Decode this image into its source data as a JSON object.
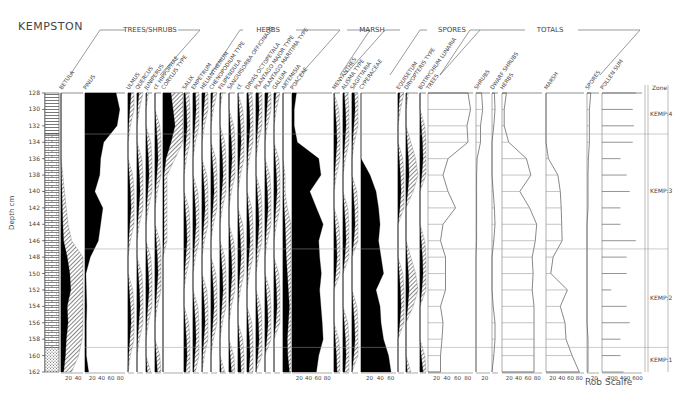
{
  "title": "KEMPSTON",
  "author": "Rob Scaife",
  "chart_data": {
    "type": "area",
    "title": "KEMPSTON",
    "ylabel": "Depth cm",
    "ylim": [
      128,
      162
    ],
    "y_ticks": [
      128,
      130,
      132,
      134,
      136,
      138,
      140,
      142,
      144,
      146,
      148,
      150,
      152,
      154,
      156,
      158,
      160,
      162
    ],
    "depths": [
      128,
      130,
      132,
      134,
      136,
      138,
      140,
      142,
      144,
      146,
      148,
      150,
      152,
      154,
      156,
      158,
      160,
      162
    ],
    "groups": [
      {
        "name": "TREES/SHRUBS",
        "taxa": [
          "BETULA",
          "PINUS",
          "ULMUS",
          "QUERCUS",
          "JUNIPERUS",
          "cf. HIPPOPHAE",
          "CORYLUS TYPE",
          "SALIX"
        ]
      },
      {
        "name": "HERBS",
        "taxa": [
          "EMPETRUM",
          "HELIANTHEMUM",
          "CHENOPODIUM TYPE",
          "FILIPENDULA",
          "SANGUISORBA OFFICINALIS",
          "cf.",
          "DRYAS OCTOPETALA",
          "PLANTAGO MAJOR TYPE",
          "PLANTAGO MARITIMA TYPE",
          "GALIUM",
          "ARTEMISIA",
          "POACEAE"
        ]
      },
      {
        "name": "MARSH",
        "taxa": [
          "MENYANTHES",
          "ALISMA TYPE",
          "SAGITTARIA",
          "CYPERACEAE"
        ]
      },
      {
        "name": "SPORES",
        "taxa": [
          "EQUISETUM",
          "DRYOPTERIS TYPE",
          "BOTRYCHIUM LUNARIA"
        ]
      },
      {
        "name": "TOTALS",
        "taxa": [
          "TREES",
          "SHRUBS",
          "DWARF SHRUBS",
          "HERBS",
          "MARSH",
          "SPORES",
          "POLLEN SUM"
        ]
      }
    ],
    "series": [
      {
        "name": "BETULA",
        "values": [
          0,
          0,
          0,
          0,
          0,
          1,
          2,
          3,
          4,
          6,
          14,
          20,
          22,
          14,
          16,
          12,
          10,
          6
        ],
        "axis_ticks": [
          "20",
          "40"
        ]
      },
      {
        "name": "PINUS",
        "values": [
          70,
          78,
          72,
          42,
          35,
          33,
          22,
          40,
          35,
          30,
          12,
          2,
          3,
          4,
          3,
          3,
          3,
          8
        ],
        "axis_ticks": [
          "20",
          "40",
          "60",
          "80"
        ]
      },
      {
        "name": "CORYLUS TYPE",
        "values": [
          8,
          10,
          12,
          8,
          3,
          1,
          1,
          1,
          1,
          1,
          0,
          0,
          0,
          0,
          0,
          0,
          0,
          0
        ]
      },
      {
        "name": "ARTEMISIA",
        "values": [
          0,
          0,
          0,
          0,
          0,
          1,
          1,
          2,
          4,
          5,
          6,
          8,
          10,
          12,
          10,
          8,
          9,
          12
        ]
      },
      {
        "name": "POACEAE",
        "values": [
          10,
          5,
          5,
          12,
          60,
          65,
          40,
          55,
          70,
          60,
          62,
          66,
          62,
          65,
          68,
          70,
          60,
          55
        ],
        "axis_ticks": [
          "20",
          "40",
          "60",
          "80"
        ]
      },
      {
        "name": "CYPERACEAE",
        "values": [
          0,
          0,
          0,
          0,
          0,
          18,
          30,
          35,
          38,
          35,
          40,
          45,
          30,
          38,
          40,
          45,
          55,
          60
        ],
        "axis_ticks": [
          "20",
          "40",
          "60"
        ]
      },
      {
        "name": "TREES (total)",
        "values": [
          80,
          85,
          78,
          80,
          40,
          30,
          40,
          55,
          30,
          25,
          35,
          35,
          35,
          25,
          30,
          28,
          25,
          25
        ],
        "axis_ticks": [
          "20",
          "40",
          "60",
          "80"
        ]
      },
      {
        "name": "SHRUBS (total)",
        "values": [
          10,
          12,
          8,
          8,
          2,
          1,
          1,
          1,
          1,
          1,
          0,
          0,
          0,
          0,
          0,
          0,
          0,
          0
        ],
        "axis_ticks": [
          "20"
        ]
      },
      {
        "name": "HERBS (total)",
        "values": [
          10,
          5,
          5,
          15,
          55,
          65,
          40,
          62,
          78,
          75,
          68,
          70,
          68,
          72,
          72,
          72,
          72,
          72
        ],
        "axis_ticks": [
          "20",
          "40",
          "60",
          "80"
        ]
      },
      {
        "name": "MARSH (total)",
        "values": [
          0,
          0,
          0,
          0,
          5,
          25,
          30,
          32,
          33,
          34,
          15,
          10,
          45,
          30,
          40,
          42,
          55,
          70
        ],
        "axis_ticks": [
          "20",
          "40",
          "60",
          "80"
        ]
      },
      {
        "name": "SPORES (total)",
        "values": [
          8,
          5,
          5,
          5,
          3,
          2,
          2,
          2,
          0,
          0,
          0,
          0,
          0,
          0,
          0,
          2,
          2,
          2
        ],
        "axis_ticks": [
          "20"
        ]
      },
      {
        "name": "POLLEN SUM",
        "values": [
          550,
          500,
          520,
          500,
          300,
          400,
          450,
          300,
          300,
          550,
          400,
          400,
          150,
          400,
          450,
          300,
          300,
          350
        ],
        "axis_ticks": [
          "200",
          "400",
          "600"
        ]
      }
    ],
    "zones": [
      {
        "label": "KEMP:4",
        "from": 128,
        "to": 133
      },
      {
        "label": "KEMP:3",
        "from": 133,
        "to": 147
      },
      {
        "label": "KEMP:2",
        "from": 147,
        "to": 159
      },
      {
        "label": "KEMP:1",
        "from": 159,
        "to": 162
      }
    ],
    "zone_header": "Zone",
    "lithology": [
      {
        "from": 128,
        "to": 133,
        "pattern": "horizontal-lines"
      },
      {
        "from": 133,
        "to": 159,
        "pattern": "brick"
      },
      {
        "from": 159,
        "to": 162,
        "pattern": "dotted"
      }
    ]
  }
}
